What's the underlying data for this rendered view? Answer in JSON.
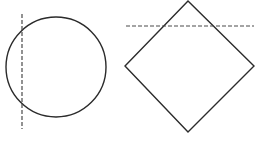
{
  "diagram": {
    "colors": {
      "stroke": "#2b2b2b",
      "dash": "#4a4a4a",
      "background": "#ffffff"
    },
    "shapes": [
      {
        "type": "circle",
        "cx": 56,
        "cy": 67,
        "r": 50
      },
      {
        "type": "diamond",
        "points": "188,1 125,66 188,132 254,66"
      }
    ],
    "dashed_lines": [
      {
        "orientation": "vertical",
        "x1": 22,
        "y1": 14,
        "x2": 22,
        "y2": 129
      },
      {
        "orientation": "horizontal",
        "x1": 126,
        "y1": 26,
        "x2": 254,
        "y2": 26
      }
    ]
  }
}
